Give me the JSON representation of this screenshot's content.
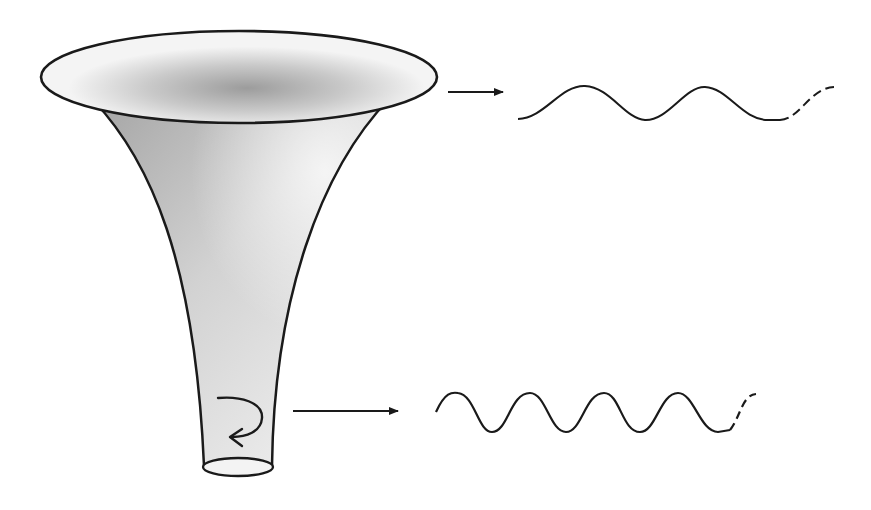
{
  "diagram": {
    "title": "",
    "colors": {
      "stroke": "#1a1a1a",
      "shade_dark": "#a8a8a8",
      "shade_light": "#f2f2f2",
      "background": "#ffffff"
    },
    "elements": {
      "funnel": {
        "label": ""
      },
      "rotation_arrow": {
        "label": ""
      },
      "top_arrow": {
        "label": ""
      },
      "bottom_arrow": {
        "label": ""
      },
      "top_wave": {
        "label": "",
        "cycles": 2,
        "continues": "dashed"
      },
      "bottom_wave": {
        "label": "",
        "cycles": 4,
        "continues": "dashed"
      }
    }
  }
}
